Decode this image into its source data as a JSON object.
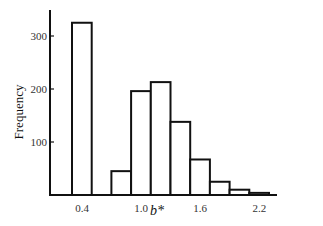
{
  "chart_data": {
    "type": "bar",
    "title": "",
    "xlabel": "b*",
    "ylabel": "Frequency",
    "bin_width": 0.2,
    "categories": [
      "0.4-0.6",
      "0.6-0.8",
      "0.8-1.0",
      "1.0-1.2",
      "1.2-1.4",
      "1.4-1.6",
      "1.6-1.8",
      "1.8-2.0",
      "2.0-2.2",
      "2.2-2.4"
    ],
    "bin_starts": [
      0.4,
      0.6,
      0.8,
      1.0,
      1.2,
      1.4,
      1.6,
      1.8,
      2.0,
      2.2
    ],
    "values": [
      325,
      0,
      45,
      196,
      213,
      138,
      67,
      25,
      10,
      4
    ],
    "xticks": [
      "0.4",
      "1.0",
      "1.6",
      "2.2"
    ],
    "xtick_values": [
      0.4,
      1.0,
      1.6,
      2.2
    ],
    "yticks": [
      "100",
      "200",
      "300"
    ],
    "ytick_values": [
      100,
      200,
      300
    ],
    "ylim": [
      0,
      350
    ],
    "xlim": [
      0.2,
      2.7
    ],
    "grid": false,
    "legend": null,
    "bar_fill": "#ffffff",
    "bar_stroke": "#111111"
  }
}
